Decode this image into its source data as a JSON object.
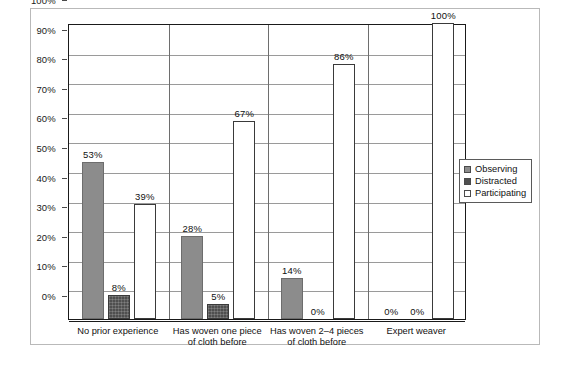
{
  "chart_data": {
    "type": "bar",
    "title": "",
    "subtitle": "",
    "xlabel": "",
    "ylabel": "",
    "ylim": [
      0,
      100
    ],
    "ytick_labels": [
      "0%",
      "10%",
      "20%",
      "30%",
      "40%",
      "50%",
      "60%",
      "70%",
      "80%",
      "90%",
      "100%"
    ],
    "ytick_values": [
      0,
      10,
      20,
      30,
      40,
      50,
      60,
      70,
      80,
      90,
      100
    ],
    "grid": true,
    "legend_position": "right-middle",
    "categories": [
      "No prior experience",
      "Has woven one piece\nof cloth before",
      "Has woven 2–4 pieces\nof cloth before",
      "Expert weaver"
    ],
    "series": [
      {
        "name": "Observing",
        "color": "#8c8c8c",
        "values": [
          53,
          28,
          14,
          0
        ],
        "labels": [
          "53%",
          "28%",
          "14%",
          "0%"
        ]
      },
      {
        "name": "Distracted",
        "color": "#4f4f4f",
        "values": [
          8,
          5,
          0,
          0
        ],
        "labels": [
          "8%",
          "5%",
          "0%",
          "0%"
        ]
      },
      {
        "name": "Participating",
        "color": "#ffffff",
        "values": [
          39,
          67,
          86,
          100
        ],
        "labels": [
          "39%",
          "67%",
          "86%",
          "100%"
        ]
      }
    ]
  },
  "legend": {
    "items": [
      {
        "label": "Observing",
        "swatch": "observing"
      },
      {
        "label": "Distracted",
        "swatch": "distracted"
      },
      {
        "label": "Participating",
        "swatch": "participating"
      }
    ]
  }
}
